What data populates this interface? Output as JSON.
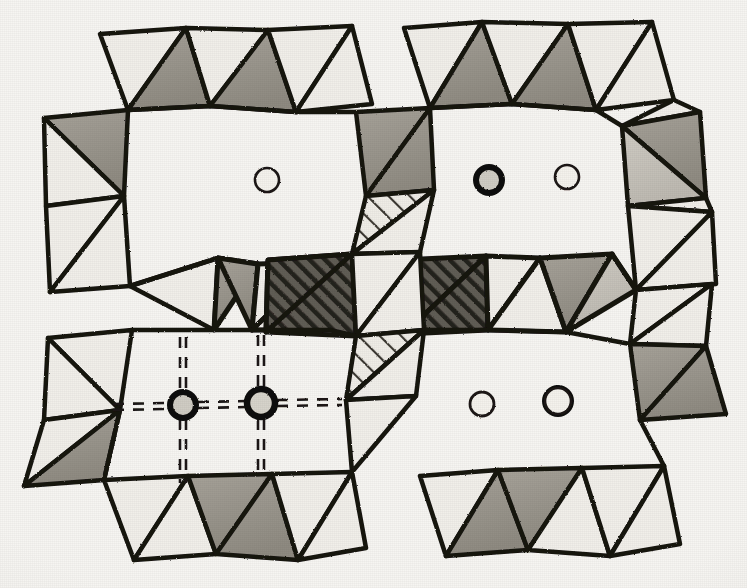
{
  "figure": {
    "kind": "crystal-structure-polyhedral-diagram",
    "caption": "",
    "background_color": "#f6f5f2",
    "ink_color": "#151310",
    "projection_note": "two unit-cell rows of corner-sharing tetrahedra framing large cavities"
  },
  "palette": {
    "paper": "#f6f5f2",
    "ink": "#151310",
    "tetra_gray": "#9a968d",
    "tetra_gray_light": "#c9c6bd",
    "tetra_white": "#f1efea",
    "tetra_dark_hatch": "#56534c",
    "tetra_light_hatch": "#e9e7e1",
    "hatch_line": "#2a2722",
    "circle_fill_open": "#f4f2ed",
    "circle_fill_filled": "#d9d6cf"
  },
  "legend_semantics": {
    "shading_types": [
      {
        "id": "gray",
        "label": "shaded tetrahedron face",
        "color": "#9a968d"
      },
      {
        "id": "white",
        "label": "unshaded tetrahedron face",
        "color": "#f1efea"
      },
      {
        "id": "dark-hatch",
        "label": "dark cross-hatched tetrahedron",
        "color": "#56534c"
      },
      {
        "id": "light-hatch",
        "label": "light hatched tetrahedron",
        "color": "#e9e7e1"
      }
    ],
    "circle_types": [
      {
        "id": "open",
        "label": "open circle — light cation site",
        "stroke_width": 2
      },
      {
        "id": "filled",
        "label": "bold circle — heavy cation site",
        "stroke_width": 6
      }
    ],
    "bond_style": {
      "id": "double-dashed",
      "label": "dashed coordination bond",
      "dash": "10 9"
    }
  },
  "cavities": [
    {
      "id": "cavity-top-left",
      "center_x": 200,
      "center_y": 205
    },
    {
      "id": "cavity-top-right",
      "center_x": 530,
      "center_y": 200
    },
    {
      "id": "cavity-bottom-left",
      "center_x": 210,
      "center_y": 420
    },
    {
      "id": "cavity-bottom-right",
      "center_x": 530,
      "center_y": 418
    }
  ],
  "atoms": [
    {
      "id": "atom-tl-1",
      "type": "open",
      "cx": 185,
      "cy": 183,
      "r": 13
    },
    {
      "id": "atom-tl-2",
      "type": "filled",
      "cx": 267,
      "cy": 180,
      "r": 12
    },
    {
      "id": "atom-tr-1",
      "type": "open",
      "cx": 489,
      "cy": 180,
      "r": 13
    },
    {
      "id": "atom-tr-2",
      "type": "filled",
      "cx": 567,
      "cy": 177,
      "r": 12
    },
    {
      "id": "atom-bl-1",
      "type": "filled",
      "cx": 183,
      "cy": 405,
      "r": 13
    },
    {
      "id": "atom-bl-2",
      "type": "open",
      "cx": 261,
      "cy": 403,
      "r": 14
    },
    {
      "id": "atom-br-1",
      "type": "filled",
      "cx": 482,
      "cy": 404,
      "r": 12
    },
    {
      "id": "atom-br-2",
      "type": "open",
      "cx": 558,
      "cy": 401,
      "r": 13
    }
  ],
  "bonds": [
    {
      "id": "bond-bl1-left",
      "x1": 113,
      "y1": 407,
      "x2": 168,
      "y2": 406
    },
    {
      "id": "bond-bl1-right",
      "x1": 198,
      "y1": 405,
      "x2": 247,
      "y2": 404
    },
    {
      "id": "bond-bl1-up",
      "x1": 183,
      "y1": 337,
      "x2": 183,
      "y2": 391
    },
    {
      "id": "bond-bl1-down",
      "x1": 183,
      "y1": 419,
      "x2": 183,
      "y2": 481
    },
    {
      "id": "bond-bl2-right",
      "x1": 276,
      "y1": 403,
      "x2": 340,
      "y2": 402
    },
    {
      "id": "bond-bl2-up",
      "x1": 261,
      "y1": 335,
      "x2": 261,
      "y2": 388
    },
    {
      "id": "bond-bl2-down",
      "x1": 261,
      "y1": 418,
      "x2": 261,
      "y2": 470
    }
  ],
  "tetrahedra_rows": [
    {
      "id": "row-top-chain",
      "y": 60,
      "count": 8,
      "note": "upper zig-zag chain of corner-sharing tetrahedra"
    },
    {
      "id": "row-upper-flank",
      "y": 170,
      "count": 6,
      "note": "flanking tetrahedra on cavity sides"
    },
    {
      "id": "row-middle-chain",
      "y": 290,
      "count": 9,
      "note": "middle chain, includes dark cross-hatched tetrahedra"
    },
    {
      "id": "row-lower-flank",
      "y": 400,
      "count": 6,
      "note": "flanking tetrahedra on lower cavity sides"
    },
    {
      "id": "row-bottom-chain",
      "y": 510,
      "count": 8,
      "note": "lower zig-zag chain of corner-sharing tetrahedra"
    }
  ],
  "counts": {
    "cavities": 4,
    "atoms": 8,
    "open_circles": 4,
    "filled_circles": 4,
    "dashed_bonds": 7
  }
}
